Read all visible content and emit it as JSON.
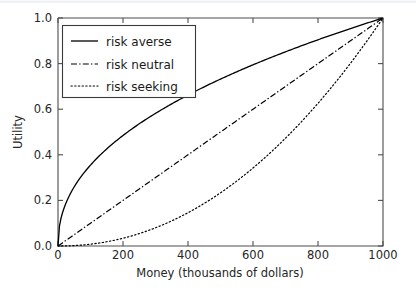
{
  "figure": {
    "background_color": "#ffffff",
    "axes_color": "#4d4d4d",
    "curve_color": "#000000"
  },
  "chart_data": {
    "type": "line",
    "title": "",
    "xlabel": "Money (thousands of  dollars)",
    "ylabel": "Utility",
    "xlim": [
      0,
      1000
    ],
    "ylim": [
      0.0,
      1.0
    ],
    "xticks": [
      0,
      200,
      400,
      600,
      800,
      1000
    ],
    "xtick_labels": [
      "0",
      "200",
      "400",
      "600",
      "800",
      "1000"
    ],
    "yticks": [
      0.0,
      0.2,
      0.4,
      0.6,
      0.8,
      1.0
    ],
    "ytick_labels": [
      "0.0",
      "0.2",
      "0.4",
      "0.6",
      "0.8",
      "1.0"
    ],
    "grid": false,
    "legend_position": "upper left",
    "x": [
      0,
      50,
      100,
      150,
      200,
      250,
      300,
      350,
      400,
      450,
      500,
      550,
      600,
      650,
      700,
      750,
      800,
      850,
      900,
      950,
      1000
    ],
    "series": [
      {
        "name": "risk averse",
        "linestyle": "solid",
        "color": "#000000",
        "values": [
          0.0,
          0.249,
          0.341,
          0.409,
          0.466,
          0.515,
          0.559,
          0.599,
          0.636,
          0.671,
          0.704,
          0.735,
          0.764,
          0.792,
          0.819,
          0.845,
          0.87,
          0.894,
          0.917,
          0.939,
          1.0
        ]
      },
      {
        "name": "risk neutral",
        "linestyle": "dashdot",
        "color": "#000000",
        "values": [
          0.0,
          0.05,
          0.1,
          0.15,
          0.2,
          0.25,
          0.3,
          0.35,
          0.4,
          0.45,
          0.5,
          0.55,
          0.6,
          0.65,
          0.7,
          0.75,
          0.8,
          0.85,
          0.9,
          0.95,
          1.0
        ]
      },
      {
        "name": "risk seeking",
        "linestyle": "dotted",
        "color": "#000000",
        "values": [
          0.0,
          0.002,
          0.008,
          0.018,
          0.032,
          0.051,
          0.074,
          0.102,
          0.134,
          0.171,
          0.212,
          0.258,
          0.308,
          0.363,
          0.423,
          0.488,
          0.557,
          0.631,
          0.71,
          0.793,
          1.0
        ]
      }
    ],
    "legend_entries": [
      {
        "label": "risk averse",
        "linestyle": "solid"
      },
      {
        "label": "risk neutral",
        "linestyle": "dashdot"
      },
      {
        "label": "risk seeking",
        "linestyle": "dotted"
      }
    ]
  }
}
